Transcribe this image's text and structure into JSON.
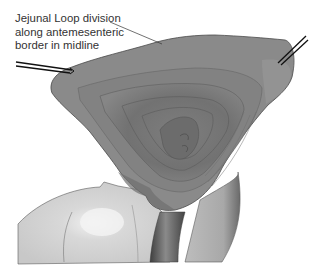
{
  "figure": {
    "annotation": {
      "lines": [
        "Jejunal Loop division",
        "along antemesenteric",
        "border in midline"
      ]
    },
    "colors": {
      "background": "#ffffff",
      "bowel_outer": "#7a7a7a",
      "bowel_mid": "#8c8c8c",
      "bowel_inner": "#6e6e6e",
      "mesentery": "#d2d2d2",
      "vessel": "#555555",
      "outline": "#4a4a4a",
      "leader_line": "#333333",
      "retractor": "#111111"
    }
  }
}
